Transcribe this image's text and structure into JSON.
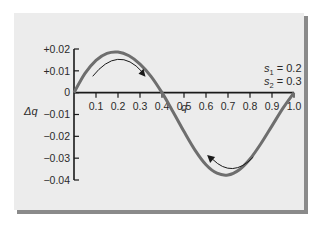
{
  "chart_data": {
    "type": "line",
    "title": "",
    "xlabel": "q",
    "ylabel": "Δq",
    "xlim": [
      0,
      1.0
    ],
    "ylim": [
      -0.04,
      0.02
    ],
    "x_ticks": [
      0.1,
      0.2,
      0.3,
      0.4,
      0.5,
      0.6,
      0.7,
      0.8,
      0.9,
      1.0
    ],
    "x_tick_labels": [
      "0.1",
      "0.2",
      "0.3",
      "0.4",
      "0.5",
      "0.6",
      "0.7",
      "0.8",
      "0.9",
      "1.0"
    ],
    "y_ticks": [
      0.02,
      0.01,
      0,
      -0.01,
      -0.02,
      -0.03,
      -0.04
    ],
    "y_tick_labels": [
      "+0.02",
      "+0.01",
      "0",
      "−0.01",
      "−0.02",
      "−0.03",
      "−0.04"
    ],
    "grid": false,
    "parameters": {
      "s1_label": "s",
      "s1_sub": "1",
      "s1_value": " = 0.2",
      "s2_label": "s",
      "s2_sub": "2",
      "s2_value": " = 0.3"
    },
    "series": [
      {
        "name": "Δq vs q",
        "color": "#6e6e6e",
        "x": [
          0,
          0.05,
          0.1,
          0.15,
          0.2,
          0.25,
          0.3,
          0.35,
          0.4,
          0.45,
          0.5,
          0.55,
          0.6,
          0.65,
          0.7,
          0.75,
          0.8,
          0.85,
          0.9,
          0.95,
          1.0
        ],
        "y": [
          0,
          0.0088,
          0.0148,
          0.018,
          0.0186,
          0.0169,
          0.0131,
          0.0075,
          0,
          -0.0087,
          -0.0178,
          -0.0263,
          -0.033,
          -0.0369,
          -0.0377,
          -0.0354,
          -0.0304,
          -0.0233,
          -0.0152,
          -0.0071,
          0
        ]
      }
    ],
    "annotations": [
      {
        "type": "arrow",
        "direction": "toward equilibrium from left",
        "region": "q 0.1–0.35, positive Δq"
      },
      {
        "type": "arrow",
        "direction": "toward equilibrium from right",
        "region": "q 0.6–0.85, negative Δq"
      }
    ]
  },
  "colors": {
    "card": "#ececec",
    "shadow": "#8a8a8a",
    "curve": "#6e6e6e",
    "axis": "#1a1a1a",
    "arrow": "#1a1a1a"
  }
}
